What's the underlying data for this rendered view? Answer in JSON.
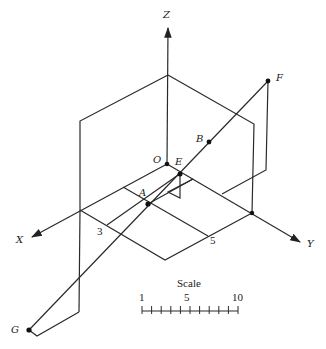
{
  "diagram": {
    "axes": {
      "x_label": "X",
      "y_label": "Y",
      "z_label": "Z"
    },
    "points": {
      "O": "O",
      "A": "A",
      "B": "B",
      "E": "E",
      "F": "F",
      "G": "G"
    },
    "ticks": {
      "x_tick": "3",
      "y_tick": "5"
    },
    "scale": {
      "title": "Scale",
      "labels": [
        "1",
        "5",
        "10"
      ],
      "divisions": 10
    },
    "colors": {
      "line": "#2a2a2a",
      "background": "#ffffff"
    }
  }
}
